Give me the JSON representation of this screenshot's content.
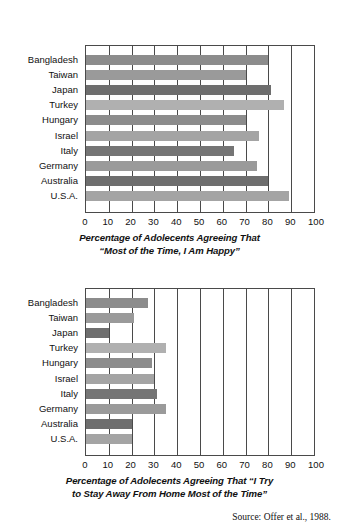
{
  "page": {
    "top_cut_text": "",
    "source_note": "Source: Offer et al., 1988."
  },
  "axis": {
    "ticks": [
      "0",
      "10",
      "20",
      "30",
      "40",
      "50",
      "60",
      "70",
      "80",
      "90",
      "100"
    ],
    "min": 0,
    "max": 100
  },
  "categories": [
    "Bangladesh",
    "Taiwan",
    "Japan",
    "Turkey",
    "Hungary",
    "Israel",
    "Italy",
    "Germany",
    "Australia",
    "U.S.A."
  ],
  "colors": {
    "frame": "#4a4a4a",
    "bar_dark": "#6e6e6e",
    "bar_mid": "#8c8c8c",
    "bar_light": "#a8a8a8",
    "background": "#ffffff",
    "text": "#111111"
  },
  "chart_data": [
    {
      "type": "bar",
      "orientation": "horizontal",
      "id": "happy-chart",
      "title": "Percentage of Adolecents Agreeing That “Most of the Time, I Am Happy”",
      "caption_line1": "Percentage of Adolecents Agreeing That",
      "caption_line2": "“Most of the Time, I Am Happy”",
      "xlabel": "",
      "ylabel": "",
      "xlim": [
        0,
        100
      ],
      "grid": true,
      "legend": "none",
      "categories": [
        "Bangladesh",
        "Taiwan",
        "Japan",
        "Turkey",
        "Hungary",
        "Israel",
        "Italy",
        "Germany",
        "Australia",
        "U.S.A."
      ],
      "values": [
        80,
        70,
        81,
        87,
        70,
        76,
        65,
        75,
        80,
        89
      ],
      "bar_colors": [
        "#8c8c8c",
        "#9a9a9a",
        "#6e6e6e",
        "#b0b0b0",
        "#8c8c8c",
        "#a4a4a4",
        "#757575",
        "#9a9a9a",
        "#6e6e6e",
        "#a4a4a4"
      ]
    },
    {
      "type": "bar",
      "orientation": "horizontal",
      "id": "away-chart",
      "title": "Percentage of Adolecents Agreeing That “I Try to Stay Away From Home Most of the Time”",
      "caption_line1": "Percentage of Adolecents Agreeing That “I Try",
      "caption_line2": "to Stay Away From Home Most of the Time”",
      "xlabel": "",
      "ylabel": "",
      "xlim": [
        0,
        100
      ],
      "grid": true,
      "legend": "none",
      "categories": [
        "Bangladesh",
        "Taiwan",
        "Japan",
        "Turkey",
        "Hungary",
        "Israel",
        "Italy",
        "Germany",
        "Australia",
        "U.S.A."
      ],
      "values": [
        27,
        21,
        10,
        35,
        29,
        30,
        31,
        35,
        20,
        20
      ],
      "bar_colors": [
        "#8c8c8c",
        "#9a9a9a",
        "#6e6e6e",
        "#b0b0b0",
        "#8c8c8c",
        "#a4a4a4",
        "#757575",
        "#9a9a9a",
        "#6e6e6e",
        "#a4a4a4"
      ]
    }
  ]
}
